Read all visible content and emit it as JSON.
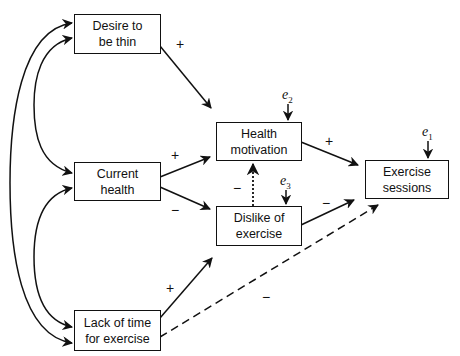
{
  "diagram": {
    "type": "path-model",
    "nodes": {
      "desire": {
        "label": "Desire to be thin",
        "line1": "Desire to",
        "line2": "be thin"
      },
      "current_health": {
        "label": "Current health",
        "line1": "Current",
        "line2": "health"
      },
      "lack_of_time": {
        "label": "Lack of time for exercise",
        "line1": "Lack of time",
        "line2": "for exercise"
      },
      "health_motivation": {
        "label": "Health motivation",
        "line1": "Health",
        "line2": "motivation"
      },
      "dislike": {
        "label": "Dislike of exercise",
        "line1": "Dislike of",
        "line2": "exercise"
      },
      "exercise_sessions": {
        "label": "Exercise sessions",
        "line1": "Exercise",
        "line2": "sessions"
      }
    },
    "errors": {
      "e1": {
        "symbol": "e",
        "sub": "1",
        "target": "Exercise sessions"
      },
      "e2": {
        "symbol": "e",
        "sub": "2",
        "target": "Health motivation"
      },
      "e3": {
        "symbol": "e",
        "sub": "3",
        "target": "Dislike of exercise"
      }
    },
    "edges": [
      {
        "from": "Desire to be thin",
        "to": "Health motivation",
        "sign": "+",
        "style": "solid"
      },
      {
        "from": "Current health",
        "to": "Health motivation",
        "sign": "+",
        "style": "solid"
      },
      {
        "from": "Current health",
        "to": "Dislike of exercise",
        "sign": "−",
        "style": "solid"
      },
      {
        "from": "Lack of time for exercise",
        "to": "Dislike of exercise",
        "sign": "+",
        "style": "solid"
      },
      {
        "from": "Lack of time for exercise",
        "to": "Exercise sessions",
        "sign": "−",
        "style": "dashed"
      },
      {
        "from": "Dislike of exercise",
        "to": "Health motivation",
        "sign": "−",
        "style": "dotted"
      },
      {
        "from": "Health motivation",
        "to": "Exercise sessions",
        "sign": "+",
        "style": "solid"
      },
      {
        "from": "Dislike of exercise",
        "to": "Exercise sessions",
        "sign": "−",
        "style": "solid"
      }
    ],
    "correlations": [
      {
        "between": [
          "Desire to be thin",
          "Lack of time for exercise"
        ]
      },
      {
        "between": [
          "Desire to be thin",
          "Current health"
        ]
      },
      {
        "between": [
          "Current health",
          "Lack of time for exercise"
        ]
      }
    ],
    "sign_labels": {
      "desire_hm": "+",
      "ch_hm": "+",
      "ch_dis": "−",
      "lack_dis": "+",
      "lack_ex": "−",
      "dis_hm": "−",
      "hm_ex": "+",
      "dis_ex": "−"
    }
  }
}
